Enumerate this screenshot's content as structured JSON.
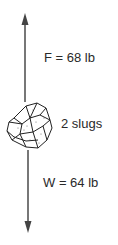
{
  "diagram": {
    "type": "free-body diagram",
    "upward_force": {
      "label": "F = 68 lb",
      "direction": "up"
    },
    "mass": {
      "label": "2 slugs",
      "object": "rock"
    },
    "weight": {
      "label": "W = 64 lb",
      "direction": "down"
    },
    "colors": {
      "arrow": "#555555",
      "text": "#2a2a2a",
      "outline": "#222222"
    }
  }
}
